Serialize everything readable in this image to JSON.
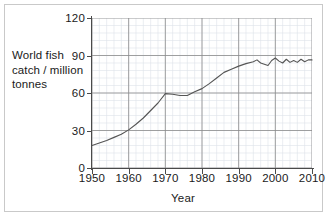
{
  "chart_data": {
    "type": "line",
    "title": "",
    "xlabel": "Year",
    "ylabel": "World fish catch / million tonnes",
    "ylabel_lines": [
      "World fish",
      "catch / million",
      "tonnes"
    ],
    "xlim": [
      1950,
      2010
    ],
    "ylim": [
      0,
      120
    ],
    "xticks": [
      1950,
      1960,
      1970,
      1980,
      1990,
      2000,
      2010
    ],
    "xtick_labels": [
      "1950",
      "1960",
      "1970",
      "1980",
      "1990",
      "2000",
      "2010"
    ],
    "yticks": [
      0,
      30,
      60,
      90,
      120
    ],
    "ytick_labels": [
      "0",
      "30",
      "60",
      "90",
      "120"
    ],
    "grid": true,
    "grid_major_spacing_x": 10,
    "grid_major_spacing_y": 30,
    "grid_minor_spacing_x": 2,
    "grid_minor_spacing_y": 6,
    "legend": null,
    "series": [
      {
        "name": "World fish catch",
        "x": [
          1950,
          1952,
          1954,
          1956,
          1958,
          1960,
          1962,
          1964,
          1966,
          1968,
          1970,
          1972,
          1974,
          1976,
          1978,
          1980,
          1982,
          1984,
          1986,
          1988,
          1990,
          1992,
          1994,
          1995,
          1996,
          1997,
          1998,
          1999,
          2000,
          2001,
          2002,
          2003,
          2004,
          2005,
          2006,
          2007,
          2008,
          2009,
          2010
        ],
        "values": [
          18,
          20,
          22,
          24.5,
          27,
          30.5,
          35,
          40,
          46,
          52,
          59.5,
          59,
          58,
          58,
          61,
          63.5,
          67.5,
          72,
          76.5,
          79,
          81.5,
          83.5,
          85,
          86.5,
          84,
          83,
          82,
          86,
          88,
          85.5,
          84,
          87,
          84.5,
          86,
          84.5,
          87,
          85,
          86.5,
          86.5
        ],
        "color": "#555555",
        "linewidth": 1.1
      }
    ],
    "colors": {
      "line": "#555555",
      "axis": "#4a4a4a",
      "grid_major": "#8a8a8a",
      "grid_minor": "#dde3ea",
      "text": "#1a1a1a",
      "frame": "#c9c9c9",
      "background": "#ffffff"
    }
  }
}
